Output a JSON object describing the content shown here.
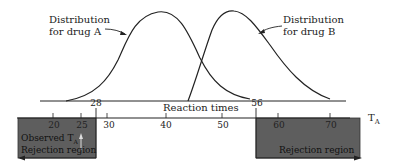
{
  "diagram": {
    "curves": [
      {
        "name": "Distribution for drug A",
        "label_line1": "Distribution",
        "label_line2": "for drug A",
        "peak_x": 40
      },
      {
        "name": "Distribution for drug B",
        "label_line1": "Distribution",
        "label_line2": "for drug B",
        "peak_x": 52
      }
    ],
    "reaction_axis": {
      "label": "Reaction times",
      "markers": [
        {
          "value": "28"
        },
        {
          "value": "56"
        }
      ]
    },
    "ta_axis": {
      "label": "T",
      "subscript": "A",
      "ticks": [
        "20",
        "25",
        "30",
        "40",
        "50",
        "60",
        "70"
      ]
    },
    "left_region": {
      "observed_label": "Observed T",
      "observed_subscript": "A",
      "region_label": "Rejection region",
      "upper_bound": "28"
    },
    "right_region": {
      "region_label": "Rejection region",
      "lower_bound": "56"
    },
    "colors": {
      "region_fill": "#5a5a5a",
      "line": "#222222"
    }
  }
}
